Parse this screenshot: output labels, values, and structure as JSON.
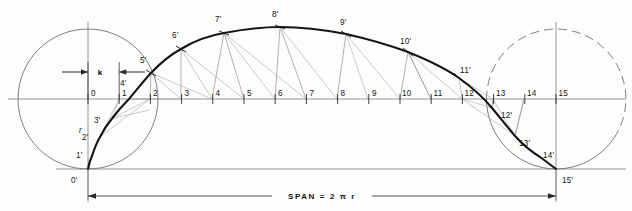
{
  "figure": {
    "title_text": "SPAN = 2 π r",
    "radius_label": "r",
    "k_label": "k",
    "background_color": "#fdfdfc",
    "ink_color": "#161616",
    "thin_line_color": "#7d7d7d",
    "construction_line_color": "#9a9a9a"
  },
  "geometry": {
    "baseline_y": 169,
    "center_y": 99,
    "circle_radius": 70,
    "left_circle_cx": 88,
    "right_circle_cx": 556,
    "tick_spacing": 31.2,
    "first_tick_x": 88,
    "apex_y": 27
  },
  "axis": {
    "tick_labels": [
      "0",
      "1",
      "2",
      "3",
      "4",
      "5",
      "6",
      "7",
      "8",
      "9",
      "10",
      "11",
      "12",
      "13",
      "14",
      "15"
    ]
  },
  "curve": {
    "point_labels": [
      "0'",
      "1'",
      "2'",
      "3'",
      "4'",
      "5'",
      "6'",
      "7'",
      "8'",
      "9'",
      "10'",
      "11'",
      "12'",
      "13'",
      "14'",
      "15'"
    ],
    "points": [
      {
        "label": "0'",
        "x": 88,
        "y": 169,
        "lx": 80,
        "ly": 180
      },
      {
        "label": "1'",
        "x": 92.5,
        "y": 154.5,
        "lx": 80,
        "ly": 157
      },
      {
        "label": "2'",
        "x": 100,
        "y": 137,
        "lx": 86,
        "ly": 139
      },
      {
        "label": "3'",
        "x": 112,
        "y": 118.5,
        "lx": 98,
        "ly": 122
      },
      {
        "label": "4'",
        "x": 129,
        "y": 99,
        "lx": 124,
        "ly": 88
      },
      {
        "label": "5'",
        "x": 151,
        "y": 73,
        "lx": 145,
        "ly": 63
      },
      {
        "label": "6'",
        "x": 181,
        "y": 49,
        "lx": 176,
        "ly": 39
      },
      {
        "label": "7'",
        "x": 224,
        "y": 33,
        "lx": 218,
        "ly": 23
      },
      {
        "label": "8'",
        "x": 280,
        "y": 27,
        "lx": 274,
        "ly": 18
      },
      {
        "label": "9'",
        "x": 346,
        "y": 34,
        "lx": 341,
        "ly": 26
      },
      {
        "label": "10'",
        "x": 408,
        "y": 52,
        "lx": 404,
        "ly": 44
      },
      {
        "label": "11'",
        "x": 459,
        "y": 78,
        "lx": 460,
        "ly": 72
      },
      {
        "label": "12'",
        "x": 492,
        "y": 108,
        "lx": 500,
        "ly": 115
      },
      {
        "label": "13'",
        "x": 515,
        "y": 136,
        "lx": 518,
        "ly": 147
      },
      {
        "label": "14'",
        "x": 540,
        "y": 157,
        "lx": 542,
        "ly": 157
      },
      {
        "label": "15'",
        "x": 556,
        "y": 169,
        "lx": 560,
        "ly": 180
      }
    ]
  },
  "annotations": {
    "span_text": "SPAN = 2 π r",
    "radius_text": "r",
    "k_text": "k"
  }
}
